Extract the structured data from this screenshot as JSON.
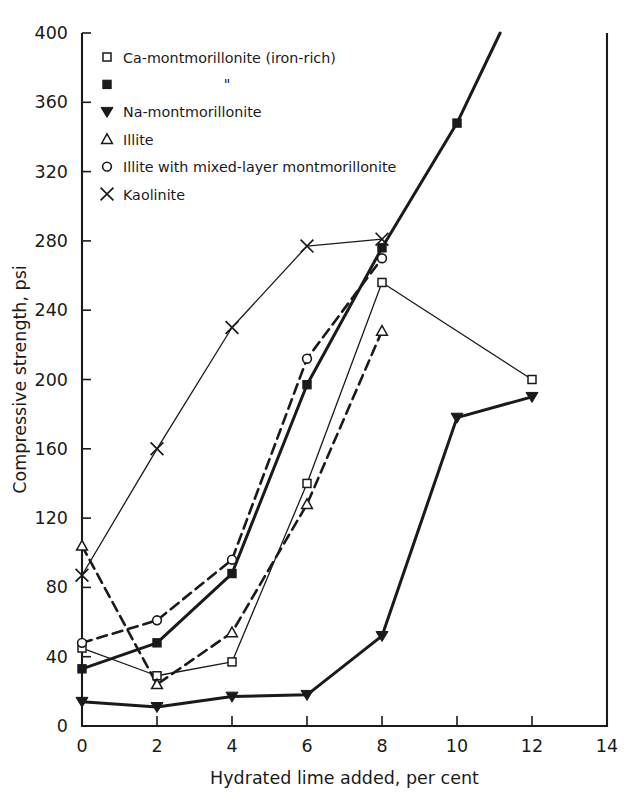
{
  "chart_data": {
    "type": "line",
    "title": "",
    "xlabel": "Hydrated lime added, per cent",
    "ylabel": "Compressive strength, psi",
    "xlim": [
      0,
      14
    ],
    "ylim": [
      0,
      400
    ],
    "xticks": [
      "0",
      "2",
      "4",
      "6",
      "8",
      "10",
      "12",
      "14"
    ],
    "yticks": [
      "0",
      "40",
      "80",
      "120",
      "160",
      "200",
      "240",
      "280",
      "320",
      "360",
      "400"
    ],
    "grid": false,
    "legend_position": "upper-left-inside",
    "series": [
      {
        "name": "Ca-montmorillonite (iron-rich)",
        "marker": "open-square",
        "linestyle": "solid-thin",
        "x": [
          0,
          2,
          4,
          6,
          8,
          12
        ],
        "values": [
          45,
          29,
          37,
          140,
          256,
          200
        ]
      },
      {
        "name": "\"",
        "marker": "filled-square",
        "linestyle": "solid-thick",
        "x": [
          0,
          2,
          4,
          6,
          8,
          10,
          11.15
        ],
        "values": [
          33,
          48,
          88,
          197,
          276,
          348,
          400
        ]
      },
      {
        "name": "Na-montmorillonite",
        "marker": "filled-triangle-down",
        "linestyle": "solid-thick",
        "x": [
          0,
          2,
          4,
          6,
          8,
          10,
          12
        ],
        "values": [
          14,
          11,
          17,
          18,
          52,
          178,
          190
        ]
      },
      {
        "name": "Illite",
        "marker": "open-triangle-up",
        "linestyle": "dashed",
        "x": [
          0,
          2,
          4,
          6,
          8
        ],
        "values": [
          104,
          24,
          54,
          128,
          228
        ]
      },
      {
        "name": "Illite with mixed-layer montmorillonite",
        "marker": "open-circle",
        "linestyle": "dashed",
        "x": [
          0,
          2,
          4,
          6,
          8
        ],
        "values": [
          48,
          61,
          96,
          212,
          270
        ]
      },
      {
        "name": "Kaolinite",
        "marker": "cross-x",
        "linestyle": "solid-thin",
        "x": [
          0,
          2,
          4,
          6,
          8
        ],
        "values": [
          87,
          160,
          230,
          277,
          281
        ]
      }
    ]
  },
  "legend": {
    "entries": [
      {
        "label": "Ca-montmorillonite (iron-rich)",
        "marker": "open-square"
      },
      {
        "label": "\"",
        "marker": "filled-square"
      },
      {
        "label": "Na-montmorillonite",
        "marker": "filled-triangle-down"
      },
      {
        "label": "Illite",
        "marker": "open-triangle-up"
      },
      {
        "label": "Illite with mixed-layer montmorillonite",
        "marker": "open-circle"
      },
      {
        "label": "Kaolinite",
        "marker": "cross-x"
      }
    ]
  },
  "colors": {
    "ink": "#1a1a1a",
    "background": "#ffffff"
  }
}
